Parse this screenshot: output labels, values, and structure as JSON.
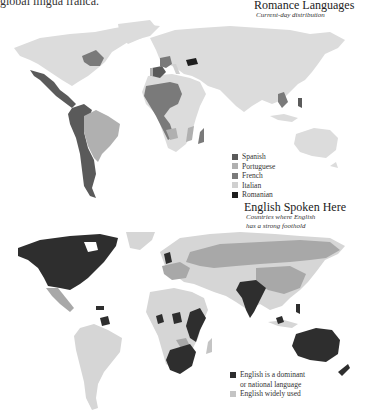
{
  "page": {
    "top_caption": "global lingua franca."
  },
  "maps": [
    {
      "title": "Romance Languages",
      "subtitle": "Current-day distribution",
      "legend": [
        {
          "label": "Spanish",
          "color": "#5a5a5a"
        },
        {
          "label": "Portuguese",
          "color": "#b0b0b0"
        },
        {
          "label": "French",
          "color": "#7a7a7a"
        },
        {
          "label": "Italian",
          "color": "#d0d0d0"
        },
        {
          "label": "Romanian",
          "color": "#1e1e1e"
        }
      ],
      "base_color": "#dcdcdc"
    },
    {
      "title": "English Spoken Here",
      "subtitle_lines": [
        "Countries where English",
        "has a strong foothold"
      ],
      "legend": [
        {
          "label_lines": [
            "English is a dominant",
            "or national language"
          ],
          "color": "#2e2e2e"
        },
        {
          "label_lines": [
            "English widely used"
          ],
          "color": "#c4c4c4"
        }
      ],
      "base_color": "#d6d6d6",
      "secondary_color": "#a8a8a8"
    }
  ]
}
